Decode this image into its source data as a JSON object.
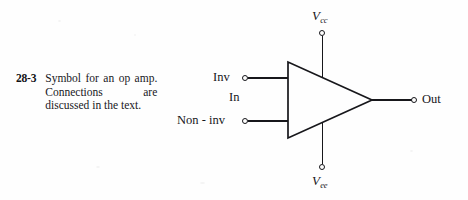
{
  "figure": {
    "number": "28-3",
    "caption": "Symbol for an op amp. Connections are discussed in the text."
  },
  "schematic": {
    "type": "op-amp-symbol",
    "body_shape": "triangle",
    "pins": {
      "inverting_input": {
        "label": "Inv",
        "terminal": "open-circle",
        "side": "left",
        "position": "upper"
      },
      "non_inverting_input": {
        "label": "Non - inv",
        "terminal": "open-circle",
        "side": "left",
        "position": "lower"
      },
      "input_group": {
        "label": "In"
      },
      "output": {
        "label": "Out",
        "terminal": "open-circle",
        "side": "right"
      },
      "positive_supply": {
        "label_base": "V",
        "label_sub": "cc",
        "terminal": "open-circle",
        "side": "top"
      },
      "negative_supply": {
        "label_base": "V",
        "label_sub": "ee",
        "terminal": "open-circle",
        "side": "bottom"
      }
    },
    "colors": {
      "ink": "#17171b",
      "paper": "#fefefe"
    }
  }
}
